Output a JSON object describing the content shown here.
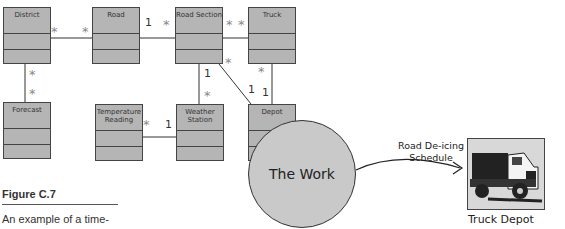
{
  "classes": [
    {
      "id": "district",
      "name": "District",
      "x": 3,
      "y": 7
    },
    {
      "id": "road",
      "name": "Road",
      "x": 92,
      "y": 7
    },
    {
      "id": "road-section",
      "name": "Road Section",
      "x": 175,
      "y": 7
    },
    {
      "id": "truck",
      "name": "Truck",
      "x": 248,
      "y": 7
    },
    {
      "id": "forecast",
      "name": "Forecast",
      "x": 3,
      "y": 102
    },
    {
      "id": "temperature-reading",
      "name": "Temperature Reading",
      "x": 95,
      "y": 104
    },
    {
      "id": "weather-station",
      "name": "Weather Station",
      "x": 176,
      "y": 104
    },
    {
      "id": "depot",
      "name": "Depot",
      "x": 248,
      "y": 104
    }
  ],
  "multiplicities": {
    "district_road_a": "*",
    "district_road_b": "*",
    "road_section_a": "1",
    "road_section_b": "*",
    "section_truck_a": "*",
    "section_truck_b": "*",
    "district_forecast_a": "*",
    "district_forecast_b": "*",
    "section_station_a": "1",
    "section_station_b": "*",
    "section_depot_a": "*",
    "section_depot_b": "1",
    "truck_depot_a": "*",
    "truck_depot_b": "1",
    "temp_station_a": "*",
    "temp_station_b": "1"
  },
  "figure": {
    "label": "Figure C.7",
    "caption": "An example of a time-"
  },
  "context": {
    "work": "The Work",
    "flow_line1": "Road De-icing",
    "flow_line2": "Schedule",
    "adjacent": "Truck Depot"
  }
}
